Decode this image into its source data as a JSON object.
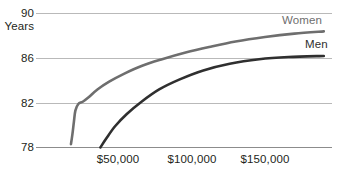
{
  "chart_data": {
    "type": "line",
    "title": "",
    "subtitle": "",
    "xlabel": "",
    "ylabel": "Years",
    "ylim": [
      78,
      90
    ],
    "xlim": [
      0,
      196000
    ],
    "grid": true,
    "gridlines_y": [
      78,
      82,
      86,
      90
    ],
    "y_ticks": [
      "78",
      "82",
      "86",
      "90"
    ],
    "y_tick_values": [
      78,
      82,
      86,
      90
    ],
    "x_ticks": [
      "$50,000",
      "$100,000",
      "$150,000"
    ],
    "x_tick_values": [
      50000,
      100000,
      150000
    ],
    "legend_position": "inline-right",
    "series": [
      {
        "name": "Women",
        "color": "#6e6e6e",
        "x": [
          18000,
          19000,
          20000,
          21000,
          23000,
          26000,
          30000,
          36000,
          44000,
          54000,
          66000,
          80000,
          96000,
          112000,
          130000,
          150000,
          170000,
          190000
        ],
        "values": [
          78.3,
          79.2,
          80.3,
          81.3,
          81.9,
          82.1,
          82.5,
          83.2,
          83.9,
          84.6,
          85.3,
          85.9,
          86.5,
          87.0,
          87.5,
          87.9,
          88.2,
          88.4
        ]
      },
      {
        "name": "Men",
        "color": "#2f2f2f",
        "x": [
          38000,
          42000,
          48000,
          56000,
          66000,
          78000,
          92000,
          108000,
          126000,
          146000,
          166000,
          190000
        ],
        "values": [
          78.0,
          78.8,
          79.9,
          81.0,
          82.1,
          83.2,
          84.1,
          84.9,
          85.5,
          85.9,
          86.1,
          86.2
        ]
      }
    ]
  },
  "axis": {
    "y_ticks": [
      {
        "label": "90"
      },
      {
        "label": "86"
      },
      {
        "label": "82"
      },
      {
        "label": "78"
      }
    ],
    "y_units_label": "Years",
    "x_ticks": [
      {
        "label": "$50,000"
      },
      {
        "label": "$100,000"
      },
      {
        "label": "$150,000"
      }
    ]
  },
  "series_labels": [
    {
      "name": "Women",
      "color": "#6e6e6e"
    },
    {
      "name": "Men",
      "color": "#2f2f2f"
    }
  ],
  "colors": {
    "background": "#ffffff",
    "text": "#231f20",
    "gridline": "#b9b9b9",
    "women_line": "#6e6e6e",
    "men_line": "#2f2f2f"
  }
}
